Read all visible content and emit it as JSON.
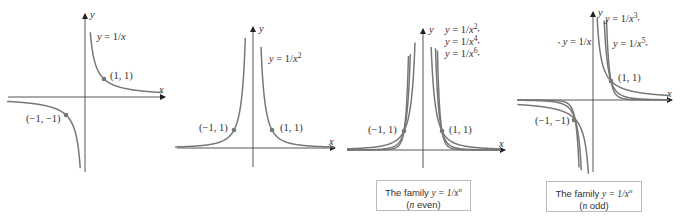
{
  "panels": [
    {
      "id": "reciprocal",
      "equation_label": "y = 1/x",
      "axis_labels": {
        "x": "x",
        "y": "y"
      },
      "points": [
        {
          "label": "(1, 1)",
          "x": 1,
          "y": 1
        },
        {
          "label": "(−1, −1)",
          "x": -1,
          "y": -1
        }
      ],
      "curves": [
        {
          "n": 1
        }
      ]
    },
    {
      "id": "reciprocal-square",
      "equation_label": "y = 1/x",
      "equation_exponent": "2",
      "axis_labels": {
        "x": "x",
        "y": "y"
      },
      "points": [
        {
          "label": "(−1, 1)",
          "x": -1,
          "y": 1
        },
        {
          "label": "(1, 1)",
          "x": 1,
          "y": 1
        }
      ],
      "curves": [
        {
          "n": 2
        }
      ]
    },
    {
      "id": "family-even",
      "legend": [
        {
          "text": "y = 1/x",
          "exponent": "2"
        },
        {
          "text": "y = 1/x",
          "exponent": "4"
        },
        {
          "text": "y = 1/x",
          "exponent": "6"
        }
      ],
      "axis_labels": {
        "x": "x",
        "y": "y"
      },
      "points": [
        {
          "label": "(−1, 1)",
          "x": -1,
          "y": 1
        },
        {
          "label": "(1, 1)",
          "x": 1,
          "y": 1
        }
      ],
      "curves": [
        {
          "n": 2
        },
        {
          "n": 4
        },
        {
          "n": 6
        }
      ],
      "caption": {
        "line1_prefix": "The family ",
        "line1_math": "y = 1/x",
        "line1_exp": "n",
        "line2_open": "(",
        "line2_var": "n",
        "line2_rest": " even)"
      }
    },
    {
      "id": "family-odd",
      "legend": [
        {
          "text": "y = 1/x",
          "exponent": "3"
        },
        {
          "text": "y = 1/x",
          "exponent": ""
        },
        {
          "text": "y = 1/x",
          "exponent": "5"
        }
      ],
      "axis_labels": {
        "x": "x",
        "y": "y"
      },
      "points": [
        {
          "label": "(1, 1)",
          "x": 1,
          "y": 1
        },
        {
          "label": "(−1, −1)",
          "x": -1,
          "y": -1
        }
      ],
      "curves": [
        {
          "n": 1
        },
        {
          "n": 3
        },
        {
          "n": 5
        }
      ],
      "caption": {
        "line1_prefix": "The family ",
        "line1_math": "y = 1/x",
        "line1_exp": "n",
        "line2_open": "(",
        "line2_var": "n",
        "line2_rest": " odd)"
      }
    }
  ],
  "colors": {
    "curve": "#777777",
    "axis": "#444444",
    "text": "#333333",
    "caption_border": "#bbbbbb"
  }
}
